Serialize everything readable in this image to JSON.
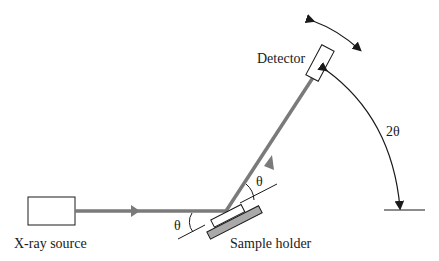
{
  "diagram": {
    "labels": {
      "source": "X-ray source",
      "detector": "Detector",
      "sample": "Sample holder",
      "theta_incident": "θ",
      "theta_diffracted": "θ",
      "two_theta": "2θ"
    },
    "colors": {
      "beam": "#7a7a7a",
      "outline": "#1a1a1a",
      "holder_fill": "#a9a9a9"
    }
  }
}
